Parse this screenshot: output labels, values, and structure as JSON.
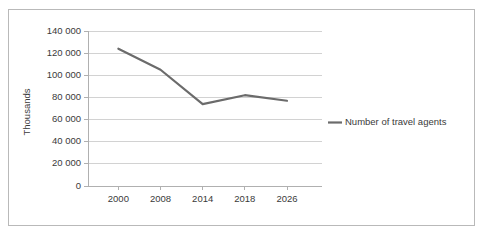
{
  "chart_data": {
    "type": "line",
    "title": "",
    "xlabel": "",
    "ylabel": "Thousands",
    "categories": [
      "2000",
      "2008",
      "2014",
      "2018",
      "2026"
    ],
    "x": [
      2000,
      2008,
      2014,
      2018,
      2026
    ],
    "series": [
      {
        "name": "Number of travel agents",
        "values": [
          124000,
          105000,
          74000,
          82000,
          77000
        ],
        "color": "#6b6b6b"
      }
    ],
    "ylim": [
      0,
      140000
    ],
    "yticks": [
      0,
      20000,
      40000,
      60000,
      80000,
      100000,
      120000,
      140000
    ],
    "ytick_labels": [
      "0",
      "20 000",
      "40 000",
      "60 000",
      "80 000",
      "100 000",
      "120 000",
      "140 000"
    ],
    "xtick_labels": [
      "2000",
      "2008",
      "2014",
      "2018",
      "2026"
    ],
    "grid": "horizontal",
    "legend_position": "right",
    "legend_entries": [
      "Number of travel agents"
    ]
  },
  "style": {
    "line_color": "#6b6b6b",
    "grid_color": "#d2d2d2",
    "axis_color": "#b0b0b0",
    "text_color": "#3a3a3a",
    "frame_color": "#b9b9b9",
    "background": "#ffffff"
  }
}
